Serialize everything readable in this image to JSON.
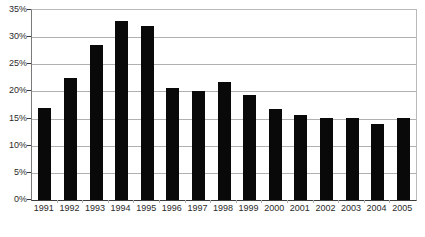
{
  "chart_data": {
    "type": "bar",
    "title": "",
    "subtitle": "",
    "xlabel": "",
    "ylabel": "",
    "categories": [
      "1991",
      "1992",
      "1993",
      "1994",
      "1995",
      "1996",
      "1997",
      "1998",
      "1999",
      "2000",
      "2001",
      "2002",
      "2003",
      "2004",
      "2005"
    ],
    "values": [
      17.0,
      22.5,
      28.5,
      33.0,
      32.0,
      20.7,
      20.0,
      21.8,
      19.3,
      16.8,
      15.6,
      15.2,
      15.2,
      14.0,
      15.2
    ],
    "series": [
      {
        "name": "",
        "values": [
          17.0,
          22.5,
          28.5,
          33.0,
          32.0,
          20.7,
          20.0,
          21.8,
          19.3,
          16.8,
          15.6,
          15.2,
          15.2,
          14.0,
          15.2
        ]
      }
    ],
    "ylim": [
      0,
      35
    ],
    "ytick_values": [
      0,
      5,
      10,
      15,
      20,
      25,
      30,
      35
    ],
    "ytick_labels": [
      "0%",
      "5%",
      "10%",
      "15%",
      "20%",
      "25%",
      "30%",
      "35%"
    ],
    "grid": true,
    "grid_axis": "y",
    "legend": null,
    "legend_position": "none",
    "annotations": [],
    "bar_color": "#090909",
    "gridline_color": "#b0b0b0",
    "axis_color": "#3a3a3a",
    "plot_background": "#ffffff",
    "tick_label_color": "#2b2b2b"
  }
}
